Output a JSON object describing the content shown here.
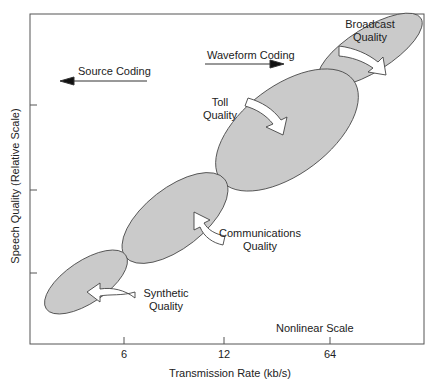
{
  "diagram": {
    "y_axis_label": "Speech Quality (Relative Scale)",
    "x_axis_label": "Transmission Rate (kb/s)",
    "x_ticks": [
      "6",
      "12",
      "64"
    ],
    "annotations": {
      "source_coding": "Source Coding",
      "waveform_coding": "Waveform Coding",
      "nonlinear": "Nonlinear Scale"
    },
    "regions": [
      {
        "line1": "Synthetic",
        "line2": "Quality"
      },
      {
        "line1": "Communications",
        "line2": "Quality"
      },
      {
        "line1": "Toll",
        "line2": "Quality"
      },
      {
        "line1": "Broadcast",
        "line2": "Quality"
      }
    ],
    "colors": {
      "ellipse_fill": "#c8c8c8",
      "stroke": "#333333"
    }
  }
}
